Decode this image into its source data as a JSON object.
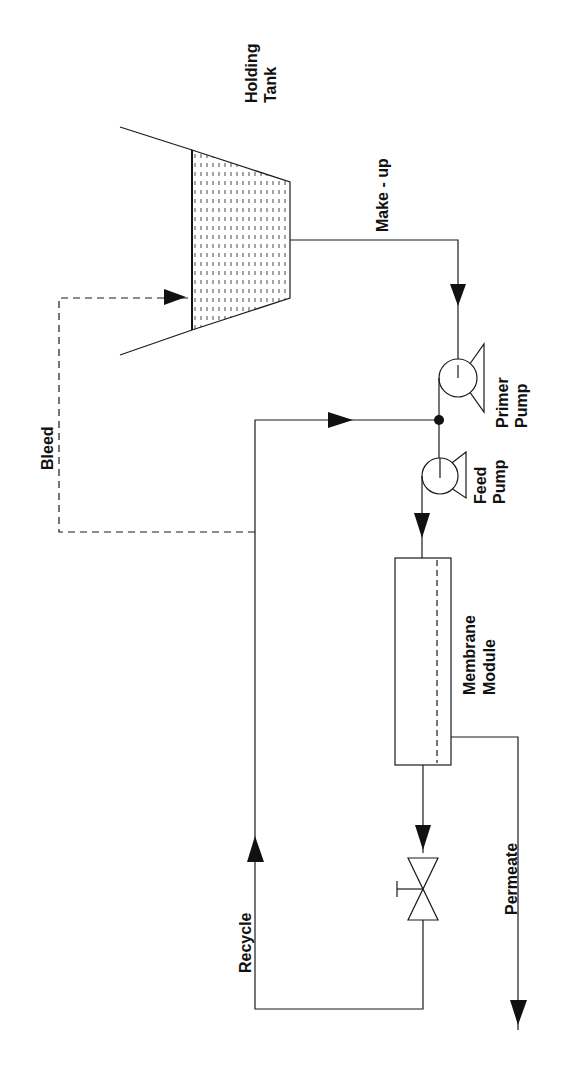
{
  "diagram": {
    "type": "process-flow",
    "orientation": "rotated-90-ccw",
    "labels": {
      "holding_tank_line1": "Holding",
      "holding_tank_line2": "Tank",
      "make_up": "Make - up",
      "bleed": "Bleed",
      "primer_pump_line1": "Primer",
      "primer_pump_line2": "Pump",
      "feed_pump_line1": "Feed",
      "feed_pump_line2": "Pump",
      "membrane_module_line1": "Membrane",
      "membrane_module_line2": "Module",
      "recycle": "Recycle",
      "permeate": "Permeate"
    },
    "components": [
      {
        "id": "holding-tank",
        "kind": "tank"
      },
      {
        "id": "primer-pump",
        "kind": "pump"
      },
      {
        "id": "feed-pump",
        "kind": "pump"
      },
      {
        "id": "membrane-module",
        "kind": "membrane"
      },
      {
        "id": "control-valve",
        "kind": "valve"
      },
      {
        "id": "junction",
        "kind": "node"
      }
    ],
    "flows": [
      {
        "from": "holding-tank",
        "to": "primer-pump",
        "label": "Make - up",
        "style": "solid"
      },
      {
        "from": "primer-pump",
        "to": "junction",
        "style": "solid"
      },
      {
        "from": "junction",
        "to": "feed-pump",
        "style": "solid"
      },
      {
        "from": "feed-pump",
        "to": "membrane-module",
        "style": "solid"
      },
      {
        "from": "membrane-module",
        "to": "control-valve",
        "label": "retentate",
        "style": "solid"
      },
      {
        "from": "control-valve",
        "to": "junction",
        "label": "Recycle",
        "style": "solid"
      },
      {
        "from": "recycle-line",
        "to": "holding-tank",
        "label": "Bleed",
        "style": "dashed"
      },
      {
        "from": "membrane-module",
        "to": "out",
        "label": "Permeate",
        "style": "solid"
      }
    ],
    "colors": {
      "stroke": "#1a1a1a",
      "background": "#ffffff"
    }
  }
}
